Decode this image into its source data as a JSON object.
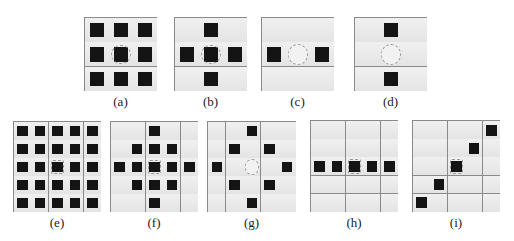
{
  "figure": {
    "panels": [
      {
        "id": "a",
        "label": "(a)",
        "size": 3,
        "center_filled": true,
        "cells": [
          [
            0,
            0
          ],
          [
            0,
            1
          ],
          [
            0,
            2
          ],
          [
            1,
            0
          ],
          [
            1,
            1
          ],
          [
            1,
            2
          ],
          [
            2,
            0
          ],
          [
            2,
            1
          ],
          [
            2,
            2
          ]
        ]
      },
      {
        "id": "b",
        "label": "(b)",
        "size": 3,
        "center_filled": true,
        "cells": [
          [
            0,
            1
          ],
          [
            1,
            0
          ],
          [
            1,
            1
          ],
          [
            1,
            2
          ],
          [
            2,
            1
          ]
        ]
      },
      {
        "id": "c",
        "label": "(c)",
        "size": 3,
        "center_filled": false,
        "cells": [
          [
            1,
            0
          ],
          [
            1,
            2
          ]
        ]
      },
      {
        "id": "d",
        "label": "(d)",
        "size": 3,
        "center_filled": false,
        "cells": [
          [
            0,
            1
          ],
          [
            2,
            1
          ]
        ]
      },
      {
        "id": "e",
        "label": "(e)",
        "size": 5,
        "center_filled": true,
        "cells": [
          [
            0,
            0
          ],
          [
            0,
            1
          ],
          [
            0,
            2
          ],
          [
            0,
            3
          ],
          [
            0,
            4
          ],
          [
            1,
            0
          ],
          [
            1,
            1
          ],
          [
            1,
            2
          ],
          [
            1,
            3
          ],
          [
            1,
            4
          ],
          [
            2,
            0
          ],
          [
            2,
            1
          ],
          [
            2,
            2
          ],
          [
            2,
            3
          ],
          [
            2,
            4
          ],
          [
            3,
            0
          ],
          [
            3,
            1
          ],
          [
            3,
            2
          ],
          [
            3,
            3
          ],
          [
            3,
            4
          ],
          [
            4,
            0
          ],
          [
            4,
            1
          ],
          [
            4,
            2
          ],
          [
            4,
            3
          ],
          [
            4,
            4
          ]
        ]
      },
      {
        "id": "f",
        "label": "(f)",
        "size": 5,
        "center_filled": true,
        "cells": [
          [
            0,
            2
          ],
          [
            1,
            1
          ],
          [
            1,
            2
          ],
          [
            1,
            3
          ],
          [
            2,
            0
          ],
          [
            2,
            1
          ],
          [
            2,
            2
          ],
          [
            2,
            3
          ],
          [
            2,
            4
          ],
          [
            3,
            1
          ],
          [
            3,
            2
          ],
          [
            3,
            3
          ],
          [
            4,
            2
          ]
        ]
      },
      {
        "id": "g",
        "label": "(g)",
        "size": 5,
        "center_filled": false,
        "cells": [
          [
            0,
            2
          ],
          [
            1,
            1
          ],
          [
            1,
            3
          ],
          [
            2,
            0
          ],
          [
            2,
            4
          ],
          [
            3,
            1
          ],
          [
            3,
            3
          ],
          [
            4,
            2
          ]
        ]
      },
      {
        "id": "h",
        "label": "(h)",
        "size": 5,
        "center_filled": true,
        "cells": [
          [
            2,
            0
          ],
          [
            2,
            1
          ],
          [
            2,
            2
          ],
          [
            2,
            3
          ],
          [
            2,
            4
          ]
        ]
      },
      {
        "id": "i",
        "label": "(i)",
        "size": 5,
        "center_filled": true,
        "cells": [
          [
            0,
            4
          ],
          [
            1,
            3
          ],
          [
            2,
            2
          ],
          [
            3,
            1
          ],
          [
            4,
            0
          ]
        ]
      }
    ]
  }
}
